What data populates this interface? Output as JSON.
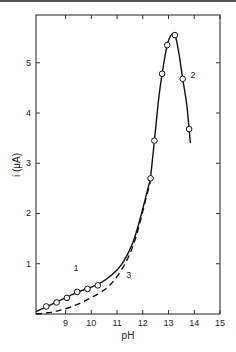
{
  "chart_data": {
    "type": "line",
    "title": "",
    "xlabel": "pH",
    "ylabel": "i (μA)",
    "xlim": [
      7.85,
      15
    ],
    "ylim": [
      0,
      5.95
    ],
    "xticks": [
      9,
      10,
      11,
      12,
      13,
      14,
      15
    ],
    "yticks": [
      1,
      2,
      3,
      4,
      5
    ],
    "grid": false,
    "legend": "none (curves labeled inline 1, 2, 3)",
    "series": [
      {
        "name": "1",
        "style": "solid",
        "markers": true,
        "points": [
          [
            8.25,
            0.15
          ],
          [
            8.65,
            0.23
          ],
          [
            9.05,
            0.32
          ],
          [
            9.45,
            0.44
          ],
          [
            9.85,
            0.5
          ],
          [
            10.25,
            0.57
          ]
        ],
        "curve": [
          [
            7.85,
            0.05
          ],
          [
            8.5,
            0.2
          ],
          [
            9.5,
            0.44
          ],
          [
            10.3,
            0.6
          ],
          [
            10.8,
            0.78
          ],
          [
            11.2,
            1.0
          ],
          [
            11.6,
            1.4
          ],
          [
            11.9,
            1.9
          ],
          [
            12.15,
            2.4
          ],
          [
            12.3,
            2.7
          ]
        ]
      },
      {
        "name": "2",
        "style": "solid",
        "markers": true,
        "points": [
          [
            12.3,
            2.7
          ],
          [
            12.45,
            3.45
          ],
          [
            12.75,
            4.78
          ],
          [
            12.95,
            5.35
          ],
          [
            13.25,
            5.55
          ],
          [
            13.55,
            4.68
          ],
          [
            13.8,
            3.68
          ]
        ],
        "curve": [
          [
            12.3,
            2.7
          ],
          [
            12.45,
            3.45
          ],
          [
            12.6,
            4.2
          ],
          [
            12.75,
            4.78
          ],
          [
            12.95,
            5.35
          ],
          [
            13.1,
            5.55
          ],
          [
            13.25,
            5.55
          ],
          [
            13.4,
            5.2
          ],
          [
            13.55,
            4.68
          ],
          [
            13.7,
            4.2
          ],
          [
            13.8,
            3.68
          ],
          [
            13.85,
            3.4
          ]
        ]
      },
      {
        "name": "3",
        "style": "dashed",
        "markers": false,
        "curve": [
          [
            7.85,
            0.0
          ],
          [
            8.5,
            0.04
          ],
          [
            9.2,
            0.14
          ],
          [
            9.9,
            0.3
          ],
          [
            10.6,
            0.52
          ],
          [
            11.1,
            0.82
          ],
          [
            11.5,
            1.2
          ],
          [
            11.8,
            1.65
          ],
          [
            12.05,
            2.15
          ],
          [
            12.3,
            2.65
          ]
        ]
      }
    ],
    "annotations": [
      {
        "text": "1",
        "x": 9.4,
        "y": 0.85
      },
      {
        "text": "2",
        "x": 13.95,
        "y": 4.7
      },
      {
        "text": "3",
        "x": 11.45,
        "y": 0.72
      }
    ]
  }
}
